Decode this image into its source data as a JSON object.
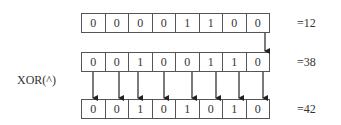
{
  "diagram": {
    "operator_label": "XOR(^)",
    "rows": [
      {
        "bits": [
          "0",
          "0",
          "0",
          "0",
          "1",
          "1",
          "0",
          "0"
        ],
        "value_label": "=12"
      },
      {
        "bits": [
          "0",
          "0",
          "1",
          "0",
          "0",
          "1",
          "1",
          "0"
        ],
        "value_label": "=38"
      },
      {
        "bits": [
          "0",
          "0",
          "1",
          "0",
          "1",
          "0",
          "1",
          "0"
        ],
        "value_label": "=42"
      }
    ],
    "colors": {
      "line": "#222222",
      "border": "#555555",
      "text": "#333333"
    }
  }
}
